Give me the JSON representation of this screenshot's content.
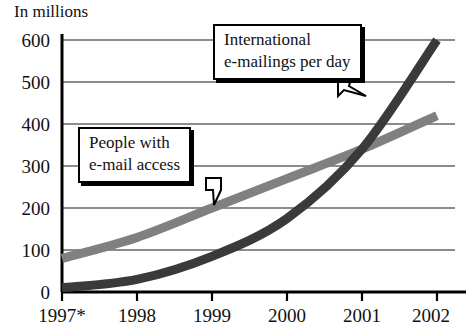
{
  "chart_data": {
    "type": "line",
    "title": "",
    "ylabel": "In millions",
    "xlabel": "",
    "categories": [
      "1997*",
      "1998",
      "1999",
      "2000",
      "2001",
      "2002"
    ],
    "x": [
      1997,
      1998,
      1999,
      2000,
      2001,
      2002
    ],
    "ylim": [
      0,
      600
    ],
    "yticks": [
      0,
      100,
      200,
      300,
      400,
      500,
      600
    ],
    "grid": true,
    "legend_position": "callout-annotations",
    "series": [
      {
        "name": "People with e-mail access",
        "color": "#808080",
        "values": [
          80,
          130,
          200,
          270,
          340,
          420
        ]
      },
      {
        "name": "International e-mailings per day",
        "color": "#3a3a3a",
        "values": [
          10,
          30,
          85,
          175,
          340,
          600
        ]
      }
    ],
    "annotations": [
      {
        "label": "International e-mailings per day",
        "target_series": "International e-mailings per day"
      },
      {
        "label": "People with e-mail access",
        "target_series": "People with e-mail access"
      }
    ],
    "footnote_marker": "*"
  },
  "axis": {
    "y_title": "In millions",
    "y_labels": [
      "600",
      "500",
      "400",
      "300",
      "200",
      "100",
      "0"
    ],
    "x_labels": [
      "1997*",
      "1998",
      "1999",
      "2000",
      "2001",
      "2002"
    ]
  },
  "callouts": {
    "emailings": {
      "line1": "International",
      "line2": "e-mailings per day"
    },
    "access": {
      "line1": "People with",
      "line2": "e-mail access"
    }
  }
}
